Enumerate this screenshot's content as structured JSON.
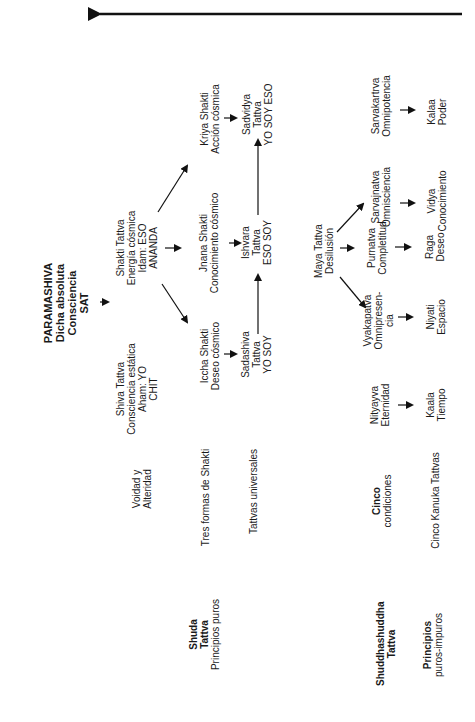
{
  "top_arrow": {
    "direction": "left",
    "color": "#111111"
  },
  "root": {
    "title": "PARAMASHIVA",
    "lines": [
      "Dicha absoluta",
      "Consciencia",
      "SAT"
    ]
  },
  "shiva_tattva": {
    "lines": [
      "Shiva Tattva",
      "Consciencia estática",
      "Aham: YO",
      "CHIT"
    ]
  },
  "shakti_tattva": {
    "lines": [
      "Shakti Tattva",
      "Energía cósmica",
      "Idam: ESO",
      "ANANDA"
    ]
  },
  "three_shaktis": {
    "iccha": {
      "lines": [
        "Iccha Shakti",
        "Deseo cósmico"
      ]
    },
    "jnana": {
      "lines": [
        "Jnana Shakti",
        "Conocimiento cósmico"
      ]
    },
    "kriya": {
      "lines": [
        "Kriya Shakti",
        "Acción cósmica"
      ]
    }
  },
  "universal_tattvas": {
    "sadashiva": {
      "lines": [
        "Sadashiva",
        "Tattva",
        "YO SOY"
      ]
    },
    "ishvara": {
      "lines": [
        "Ishvara",
        "Tattva",
        "ESO SOY"
      ]
    },
    "sadvidya": {
      "lines": [
        "Sadvidya",
        "Tattva",
        "YO SOY ESO"
      ]
    }
  },
  "maya_tattva": {
    "lines": [
      "Maya Tattva",
      "Desilusión"
    ]
  },
  "conditions": {
    "nityatva": {
      "lines": [
        "Nityayva",
        "Eternidad"
      ]
    },
    "vyakapatva": {
      "lines": [
        "Vyakapatva",
        "Omnipresen-",
        "cia"
      ]
    },
    "purnatva": {
      "lines": [
        "Purnatva",
        "Completitud"
      ]
    },
    "sarvajnatva": {
      "lines": [
        "Sarvajnatva",
        "Omnisciencia"
      ]
    },
    "sarvakartva": {
      "lines": [
        "Sarvakartrva",
        "Omnipotencia"
      ]
    }
  },
  "kanukas": {
    "kaala": {
      "lines": [
        "Kaala",
        "Tiempo"
      ]
    },
    "niyati": {
      "lines": [
        "Niyati",
        "Espacio"
      ]
    },
    "raga": {
      "lines": [
        "Raga",
        "Deseo"
      ]
    },
    "vidya": {
      "lines": [
        "Vidya",
        "Conocimiento"
      ]
    },
    "kalaa": {
      "lines": [
        "Kalaa",
        "Poder"
      ]
    }
  },
  "row_labels": {
    "voidness": {
      "lines": [
        "Voidad y",
        "Alteridad"
      ]
    },
    "three_forms": {
      "lines": [
        "Tres formas de Shakti"
      ]
    },
    "universal": {
      "lines": [
        "Tattvas universales"
      ]
    },
    "five_conditions": {
      "lines": [
        "Cinco",
        "condiciones"
      ]
    },
    "five_kanuka": {
      "lines": [
        "Cinco Kanuka Tattvas"
      ]
    }
  },
  "section_labels": {
    "shuda": {
      "lines": [
        "Shuda",
        "Tattva",
        "Principios puros"
      ]
    },
    "shuddhashuddha": {
      "lines": [
        "Shuddhashuddha",
        "Tattva"
      ]
    },
    "pure_impure": {
      "lines": [
        "Principios",
        "puros-impuros"
      ]
    }
  }
}
